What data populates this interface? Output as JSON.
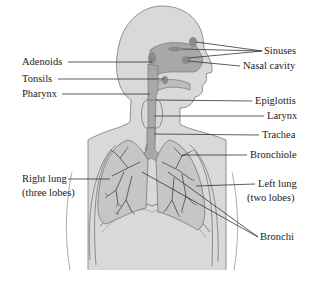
{
  "colors": {
    "body_fill": "#d9d9d9",
    "body_outline": "#7a7a7a",
    "airway_fill": "#a8a8a8",
    "lung_fill": "#c6c6c6",
    "lung_branch": "#555555",
    "leader_line": "#333333",
    "text": "#1a1a1a",
    "background": "#ffffff"
  },
  "labels": {
    "left": [
      {
        "id": "adenoids",
        "text": "Adenoids"
      },
      {
        "id": "tonsils",
        "text": "Tonsils"
      },
      {
        "id": "pharynx",
        "text": "Pharynx"
      },
      {
        "id": "right_lung",
        "text": "Right lung"
      },
      {
        "id": "right_lung_note",
        "text": "(three lobes)"
      }
    ],
    "right": [
      {
        "id": "sinuses",
        "text": "Sinuses"
      },
      {
        "id": "nasal_cavity",
        "text": "Nasal cavity"
      },
      {
        "id": "epiglottis",
        "text": "Epiglottis"
      },
      {
        "id": "larynx",
        "text": "Larynx"
      },
      {
        "id": "trachea",
        "text": "Trachea"
      },
      {
        "id": "bronchiole",
        "text": "Bronchiole"
      },
      {
        "id": "left_lung",
        "text": "Left lung"
      },
      {
        "id": "left_lung_note",
        "text": "(two lobes)"
      },
      {
        "id": "bronchi",
        "text": "Bronchi"
      }
    ]
  }
}
